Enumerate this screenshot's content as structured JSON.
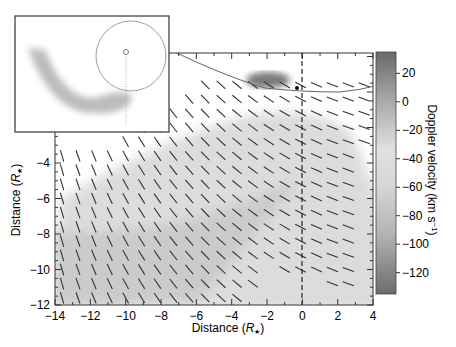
{
  "chart_data": {
    "type": "heatmap",
    "title": "",
    "xlabel": "Distance (R★)",
    "ylabel": "Distance (R★)",
    "xlim": [
      -14,
      4
    ],
    "ylim": [
      -12,
      2.2
    ],
    "x_ticks": [
      "-14",
      "-12",
      "-10",
      "-8",
      "-6",
      "-4",
      "-2",
      "0",
      "2",
      "4"
    ],
    "y_ticks": [
      "-12",
      "-10",
      "-8",
      "-6",
      "-4"
    ],
    "colorbar": {
      "label": "Doppler velocity (km s⁻¹)",
      "ticks": [
        "20",
        "0",
        "-20",
        "-40",
        "-60",
        "-80",
        "-100",
        "-120"
      ],
      "range": [
        35,
        -135
      ]
    },
    "features": {
      "velocity_vectors": "arrow field pointing down-right, steeper near left edge",
      "vertical_dashed_line_x": 0,
      "star_marker": [
        0,
        0.5
      ],
      "curved_boundary_line": "arc from top-left (-8,2) down to (2,0.3)"
    },
    "inset": {
      "description": "schematic: circle with central point and dotted vertical line; gray curved stream spiraling from circle bottom toward upper left"
    }
  },
  "axes": {
    "x_label_text": "Distance (",
    "x_label_sym": "R",
    "y_label_text": "Distance (",
    "y_label_sym": "R"
  },
  "colorbar": {
    "label": "Doppler velocity (km s",
    "label_sup": "−1",
    "ticks": [
      "20",
      "0",
      "−20",
      "−40",
      "−60",
      "−80",
      "−100",
      "−120"
    ]
  },
  "xticks": [
    "−14",
    "−12",
    "−10",
    "−8",
    "−6",
    "−4",
    "−2",
    "0",
    "2",
    "4"
  ],
  "yticks": [
    "−12",
    "−10",
    "−8",
    "−6",
    "−4"
  ]
}
